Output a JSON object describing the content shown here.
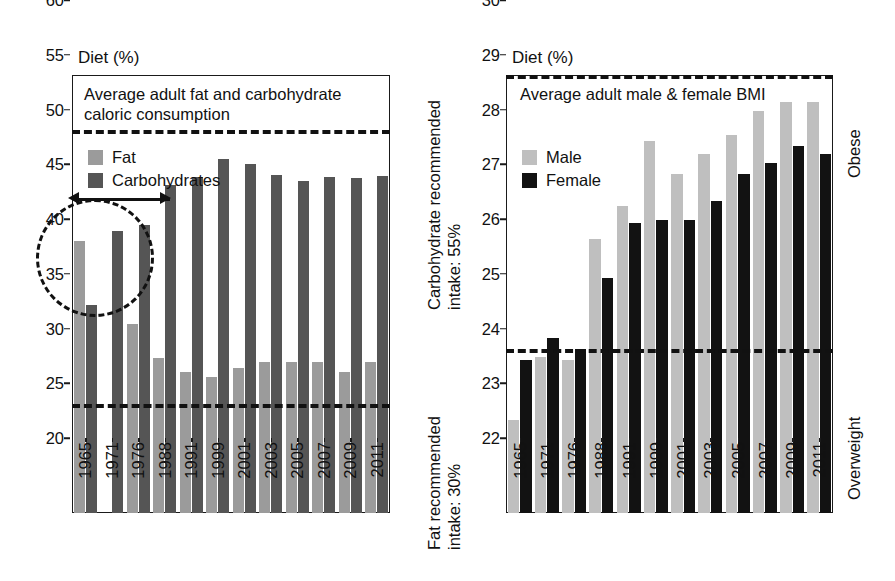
{
  "chart_data": [
    {
      "type": "bar",
      "id": "diet-composition",
      "title": "Average adult fat and carbohydrate\ncaloric consumption",
      "axis_caption": "Diet (%)",
      "xlabel": "",
      "ylabel": "Diet (%)",
      "ylim": [
        20,
        60
      ],
      "yticks": [
        20,
        25,
        30,
        35,
        40,
        45,
        50,
        55,
        60
      ],
      "grid": false,
      "legend_position": "top-left inside",
      "categories": [
        "1965",
        "1971",
        "1976",
        "1988",
        "1991",
        "1999",
        "2001",
        "2003",
        "2005",
        "2007",
        "2009",
        "2011"
      ],
      "series": [
        {
          "name": "Fat",
          "color": "#9b9b9b",
          "values": [
            44.8,
            20.0,
            37.3,
            34.2,
            32.9,
            32.4,
            33.2,
            33.8,
            33.8,
            33.8,
            32.9,
            33.8
          ]
        },
        {
          "name": "Carbohydrates",
          "color": "#555555",
          "values": [
            39.0,
            45.8,
            46.3,
            50.0,
            50.7,
            52.3,
            51.9,
            50.9,
            50.3,
            50.7,
            50.6,
            50.8
          ]
        }
      ],
      "reference_lines": [
        {
          "value": 55,
          "label": "Carbohydrate recommended intake: 55%",
          "style": "dashed"
        },
        {
          "value": 30,
          "label": "Fat recommended intake: 30%",
          "style": "dashed"
        }
      ],
      "annotations": [
        {
          "type": "circle",
          "note": "highlight of 1965 fat vs carbohydrate crossover"
        },
        {
          "type": "double-arrow",
          "note": "span from 1965 to 1976"
        }
      ]
    },
    {
      "type": "bar",
      "id": "bmi",
      "title": "Average adult male & female BMI",
      "axis_caption": "Diet (%)",
      "xlabel": "",
      "ylabel": "BMI",
      "ylim": [
        22,
        30
      ],
      "yticks": [
        22,
        23,
        24,
        25,
        26,
        27,
        28,
        29,
        30
      ],
      "grid": false,
      "legend_position": "top-left inside",
      "categories": [
        "1965",
        "1971",
        "1976",
        "1988",
        "1991",
        "1999",
        "2001",
        "2003",
        "2005",
        "2007",
        "2009",
        "2011"
      ],
      "series": [
        {
          "name": "Male",
          "color": "#bfbfbf",
          "values": [
            23.7,
            24.85,
            24.8,
            27.0,
            27.6,
            28.8,
            28.2,
            28.55,
            28.9,
            29.35,
            29.5,
            29.5
          ]
        },
        {
          "name": "Female",
          "color": "#121212",
          "values": [
            24.8,
            25.2,
            25.0,
            26.3,
            27.3,
            27.35,
            27.35,
            27.7,
            28.2,
            28.4,
            28.7,
            28.55
          ]
        }
      ],
      "reference_lines": [
        {
          "value": 30,
          "label": "Obese",
          "style": "dashed"
        },
        {
          "value": 25,
          "label": "Overweight",
          "style": "dashed"
        }
      ]
    }
  ],
  "left_chart": {
    "axis_caption": "Diet (%)",
    "title_line1": "Average adult fat and carbohydrate",
    "title_line2": "caloric consumption",
    "legend": [
      {
        "label": "Fat"
      },
      {
        "label": "Carbohydrates"
      }
    ]
  },
  "right_chart": {
    "axis_caption": "Diet (%)",
    "title": "Average adult male & female BMI",
    "legend": [
      {
        "label": "Male"
      },
      {
        "label": "Female"
      }
    ]
  },
  "side_annotations": {
    "carb_recommended": "Carbohydrate recommended\nintake: 55%",
    "fat_recommended": "Fat recommended\nintake: 30%",
    "obese": "Obese",
    "overweight": "Overweight"
  },
  "colors": {
    "fat": "#9b9b9b",
    "carbohydrates": "#555555",
    "male": "#bfbfbf",
    "female": "#121212",
    "axis": "#1a1a1a",
    "refline": "#111111"
  }
}
